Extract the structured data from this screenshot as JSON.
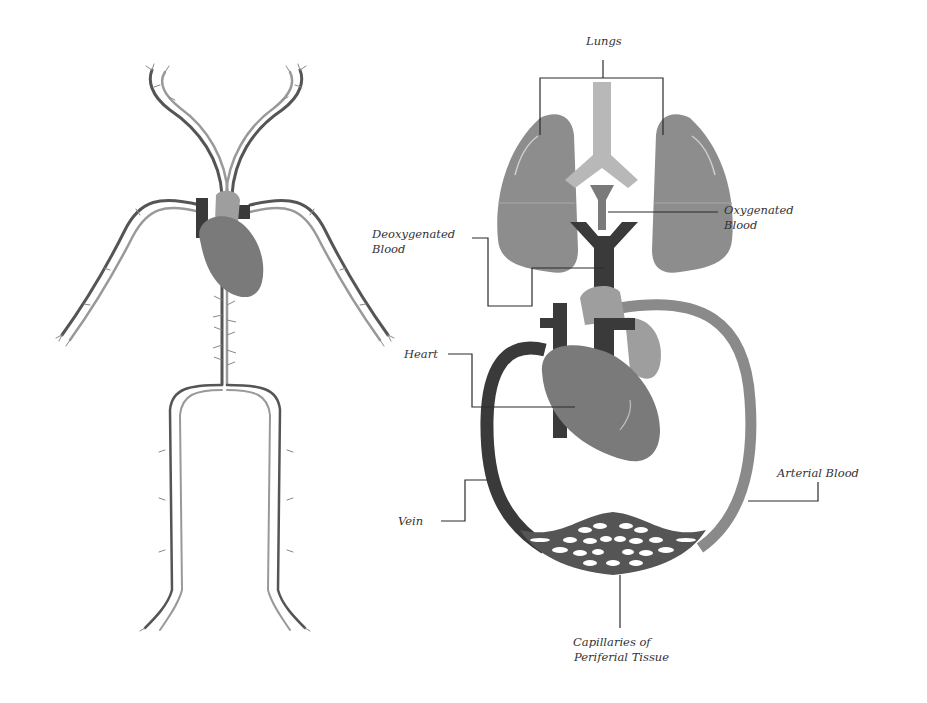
{
  "diagram": {
    "colors": {
      "background": "#ffffff",
      "lung": "#8d8d8d",
      "trachea": "#b8b8b8",
      "heart": "#7a7a7a",
      "heart_upper": "#9e9e9e",
      "vein_dark": "#3a3a3a",
      "artery_light": "#8a8a8a",
      "leader_line": "#2a2a2a",
      "label_text": "#333333"
    },
    "left_figure": {
      "name": "Full body vascular network",
      "parts": [
        "head vessels",
        "arm vessels",
        "heart",
        "torso vessel",
        "leg vessels"
      ]
    },
    "right_figure": {
      "labels": {
        "lungs": "Lungs",
        "oxygenated_line1": "Oxygenated",
        "oxygenated_line2": "Blood",
        "deoxygenated_line1": "Deoxygenated",
        "deoxygenated_line2": "Blood",
        "heart": "Heart",
        "vein": "Vein",
        "arterial": "Arterial Blood",
        "capillaries_line1": "Capillaries of",
        "capillaries_line2": "Periferial Tissue"
      }
    }
  }
}
